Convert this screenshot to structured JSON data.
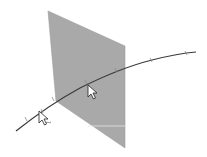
{
  "diagram": {
    "description": "Plane intersecting a curve, with selection cursors",
    "colors": {
      "background": "#ffffff",
      "plane_fill": "#a9a9a9",
      "plane_edge": "#9a9a9a",
      "curve": "#3a3a3a",
      "tick": "#8a8a8a",
      "cursor_fill": "#ffffff",
      "cursor_stroke": "#222222"
    },
    "elements": {
      "plane": {
        "label": "plane"
      },
      "curve": {
        "label": "curve"
      },
      "cursor_on_plane": {
        "label": "cursor"
      },
      "cursor_on_curve": {
        "label": "cursor with curve-select marker"
      }
    }
  }
}
